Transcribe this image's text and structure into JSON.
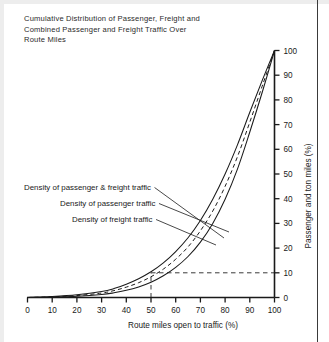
{
  "chart_data": {
    "type": "line",
    "title": "Cumulative Distribution of Passenger, Freight and\nCombined Passenger and Freight Traffic Over\nRoute Miles",
    "xlabel": "Route miles open to traffic (%)",
    "ylabel": "Passenger and ton miles (%)",
    "xlim": [
      0,
      100
    ],
    "ylim": [
      0,
      100
    ],
    "xticks": [
      "0",
      "10",
      "20",
      "30",
      "40",
      "50",
      "60",
      "70",
      "80",
      "90",
      "100"
    ],
    "yticks": [
      "0",
      "10",
      "20",
      "30",
      "40",
      "50",
      "60",
      "70",
      "80",
      "90",
      "100"
    ],
    "grid": false,
    "legend_position": "inline-annotations",
    "x": [
      0,
      10,
      20,
      30,
      35,
      40,
      45,
      50,
      55,
      60,
      65,
      70,
      75,
      80,
      85,
      90,
      95,
      100
    ],
    "series": [
      {
        "name": "Density of passenger & freight traffic",
        "style": "dashed",
        "values": [
          0,
          0.3,
          0.8,
          1.8,
          2.8,
          4.2,
          6.0,
          8.4,
          11.5,
          15.5,
          20.5,
          27.0,
          35.0,
          45.0,
          57.0,
          71.0,
          85.5,
          100
        ]
      },
      {
        "name": "Density of passenger traffic",
        "style": "solid",
        "values": [
          0,
          0.4,
          1.1,
          2.4,
          3.6,
          5.4,
          7.6,
          10.4,
          14.0,
          18.6,
          24.2,
          31.2,
          39.8,
          50.0,
          61.8,
          75.0,
          87.8,
          100
        ]
      },
      {
        "name": "Density of freight traffic",
        "style": "solid",
        "values": [
          0,
          0.2,
          0.5,
          1.2,
          1.9,
          2.9,
          4.3,
          6.2,
          8.8,
          12.2,
          16.6,
          22.4,
          30.0,
          39.8,
          52.0,
          67.0,
          83.0,
          100
        ]
      }
    ],
    "reference_lines": [
      {
        "name": "baseline-dashed",
        "orientation": "horizontal",
        "value": 0,
        "from": 0,
        "to": 100
      },
      {
        "name": "ten-percent-dashed",
        "orientation": "horizontal",
        "value": 10,
        "from": 50,
        "to": 100
      },
      {
        "name": "fifty-percent-dashed",
        "orientation": "vertical",
        "value": 50,
        "from": 0,
        "to": 10
      }
    ],
    "annotations": [
      {
        "name": "annotation-combined",
        "text": "Density of passenger & freight traffic",
        "text_x": 24,
        "text_y": 190,
        "leader_to_x": 224,
        "leader_to_y": 238
      },
      {
        "name": "annotation-passenger",
        "text": "Density of passenger traffic",
        "text_x": 60,
        "text_y": 206,
        "leader_to_x": 229,
        "leader_to_y": 232
      },
      {
        "name": "annotation-freight",
        "text": "Density of freight traffic",
        "text_x": 72,
        "text_y": 222,
        "leader_to_x": 216,
        "leader_to_y": 245
      }
    ]
  },
  "colors": {
    "ink": "#1a1a1a",
    "axis": "#1a1a1a",
    "dashed": "#3a3a3a",
    "background": "#ffffff",
    "gutter": "#ededed",
    "rule": "#3a3a3a"
  }
}
